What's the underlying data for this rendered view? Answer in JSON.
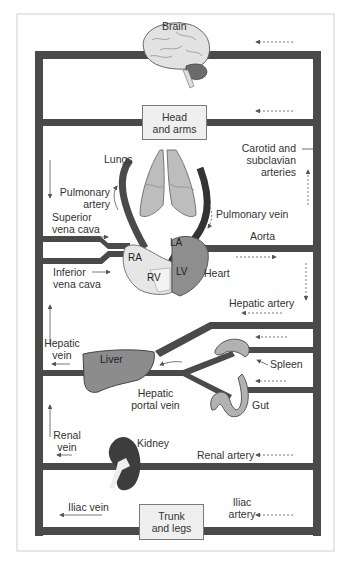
{
  "diagram": {
    "colors": {
      "vessel": "#4a4a4a",
      "frame": "#cfcfcf",
      "box_fill": "#efefef",
      "organ_light": "#d9d9d9",
      "organ_mid": "#a8a8a8",
      "organ_dark": "#6e6e6e",
      "kidney": "#3d3d3d",
      "text": "#333333"
    },
    "boxes": {
      "head": "Head\nand arms",
      "head_line1": "Head",
      "head_line2": "and arms",
      "trunk_line1": "Trunk",
      "trunk_line2": "and legs"
    },
    "organs": {
      "brain": "Brain",
      "lungs": "Lungs",
      "heart": "Heart",
      "liver": "Liver",
      "spleen": "Spleen",
      "gut": "Gut",
      "kidney": "Kidney"
    },
    "heart_chambers": {
      "ra": "RA",
      "rv": "RV",
      "la": "LA",
      "lv": "LV"
    },
    "vessels": {
      "carotid_1": "Carotid and",
      "carotid_2": "subclavian",
      "carotid_3": "arteries",
      "pulmonary_artery_1": "Pulmonary",
      "pulmonary_artery_2": "artery",
      "pulmonary_vein": "Pulmonary vein",
      "superior_vc_1": "Superior",
      "superior_vc_2": "vena cava",
      "inferior_vc_1": "Inferior",
      "inferior_vc_2": "vena cava",
      "aorta": "Aorta",
      "hepatic_artery": "Hepatic artery",
      "hepatic_vein_1": "Hepatic",
      "hepatic_vein_2": "vein",
      "hepatic_portal_1": "Hepatic",
      "hepatic_portal_2": "portal vein",
      "renal_vein_1": "Renal",
      "renal_vein_2": "vein",
      "renal_artery": "Renal artery",
      "iliac_vein": "Iliac vein",
      "iliac_artery_1": "Iliac",
      "iliac_artery_2": "artery"
    }
  }
}
